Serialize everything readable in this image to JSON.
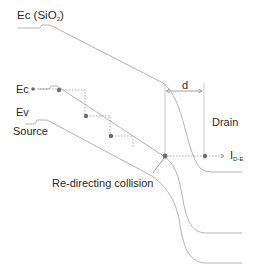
{
  "diagram": {
    "type": "band-diagram",
    "labels": {
      "ec_oxide": "Ec (SiO",
      "ec_oxide_sub": "2",
      "ec_oxide_close": ")",
      "ec": "Ec",
      "ev": "Ev",
      "source": "Source",
      "drain": "Drain",
      "d": "d",
      "collision": "Re-directing collision",
      "current": "I",
      "current_sub": "D-E"
    },
    "colors": {
      "band_line": "#b4b4b4",
      "dot": "#6e6e6e",
      "dotted": "#9a9a9a",
      "text": "#2a2a2a"
    },
    "electron_path_points": 5
  }
}
